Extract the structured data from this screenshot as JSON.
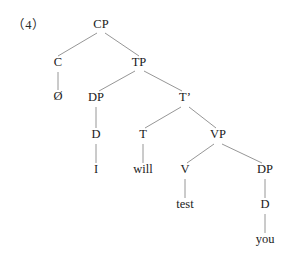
{
  "figure": {
    "example_number": "（4）",
    "caption": "",
    "background_color": "#ffffff",
    "line_color": "#8a8a8a",
    "text_color": "#1a1a1a"
  },
  "tree": {
    "type": "syntax-tree",
    "sentence": "Ø I will test you",
    "nodes": [
      {
        "id": "CP",
        "label": "CP",
        "x": 101,
        "y": 28,
        "kind": "phrase"
      },
      {
        "id": "C",
        "label": "C",
        "x": 58,
        "y": 66,
        "kind": "head"
      },
      {
        "id": "Cnull",
        "label": "Ø",
        "x": 58,
        "y": 100,
        "kind": "terminal"
      },
      {
        "id": "TP",
        "label": "TP",
        "x": 139,
        "y": 66,
        "kind": "phrase"
      },
      {
        "id": "DPsubj",
        "label": "DP",
        "x": 96,
        "y": 101,
        "kind": "phrase"
      },
      {
        "id": "Dsubj",
        "label": "D",
        "x": 96,
        "y": 138,
        "kind": "head"
      },
      {
        "id": "I",
        "label": "I",
        "x": 96,
        "y": 173,
        "kind": "terminal"
      },
      {
        "id": "Tbar",
        "label": "T’",
        "x": 185,
        "y": 101,
        "kind": "bar"
      },
      {
        "id": "T",
        "label": "T",
        "x": 143,
        "y": 138,
        "kind": "head"
      },
      {
        "id": "will",
        "label": "will",
        "x": 143,
        "y": 173,
        "kind": "terminal"
      },
      {
        "id": "VP",
        "label": "VP",
        "x": 218,
        "y": 138,
        "kind": "phrase"
      },
      {
        "id": "V",
        "label": "V",
        "x": 185,
        "y": 173,
        "kind": "head"
      },
      {
        "id": "test",
        "label": "test",
        "x": 185,
        "y": 208,
        "kind": "terminal"
      },
      {
        "id": "DPobj",
        "label": "DP",
        "x": 265,
        "y": 173,
        "kind": "phrase"
      },
      {
        "id": "Dobj",
        "label": "D",
        "x": 265,
        "y": 208,
        "kind": "head"
      },
      {
        "id": "you",
        "label": "you",
        "x": 265,
        "y": 243,
        "kind": "terminal"
      }
    ],
    "edges": [
      {
        "from": "CP",
        "to": "C",
        "x1": 97,
        "y1": 33,
        "x2": 58,
        "y2": 56
      },
      {
        "from": "CP",
        "to": "TP",
        "x1": 105,
        "y1": 33,
        "x2": 139,
        "y2": 56
      },
      {
        "from": "C",
        "to": "Cnull",
        "x1": 58,
        "y1": 72,
        "x2": 58,
        "y2": 90
      },
      {
        "from": "TP",
        "to": "DPsubj",
        "x1": 135,
        "y1": 71,
        "x2": 99,
        "y2": 91
      },
      {
        "from": "TP",
        "to": "Tbar",
        "x1": 144,
        "y1": 71,
        "x2": 182,
        "y2": 91
      },
      {
        "from": "DPsubj",
        "to": "Dsubj",
        "x1": 96,
        "y1": 107,
        "x2": 96,
        "y2": 128
      },
      {
        "from": "Dsubj",
        "to": "I",
        "x1": 96,
        "y1": 144,
        "x2": 96,
        "y2": 163
      },
      {
        "from": "Tbar",
        "to": "T",
        "x1": 181,
        "y1": 107,
        "x2": 145,
        "y2": 128
      },
      {
        "from": "Tbar",
        "to": "VP",
        "x1": 189,
        "y1": 107,
        "x2": 216,
        "y2": 128
      },
      {
        "from": "T",
        "to": "will",
        "x1": 143,
        "y1": 144,
        "x2": 143,
        "y2": 163
      },
      {
        "from": "VP",
        "to": "V",
        "x1": 214,
        "y1": 144,
        "x2": 187,
        "y2": 163
      },
      {
        "from": "VP",
        "to": "DPobj",
        "x1": 222,
        "y1": 144,
        "x2": 262,
        "y2": 163
      },
      {
        "from": "V",
        "to": "test",
        "x1": 185,
        "y1": 179,
        "x2": 185,
        "y2": 198
      },
      {
        "from": "DPobj",
        "to": "Dobj",
        "x1": 265,
        "y1": 179,
        "x2": 265,
        "y2": 198
      },
      {
        "from": "Dobj",
        "to": "you",
        "x1": 265,
        "y1": 214,
        "x2": 265,
        "y2": 233
      }
    ]
  }
}
